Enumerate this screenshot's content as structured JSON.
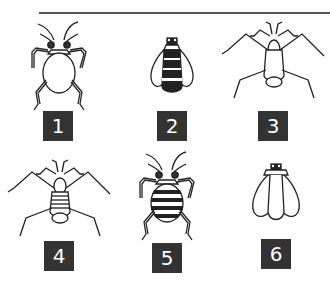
{
  "figure": {
    "colors": {
      "line": "#222222",
      "label_bg": "#333333",
      "label_text": "#ffffff",
      "rule": "#555555"
    },
    "items": [
      {
        "id": 1,
        "label": "1",
        "type": "oval-bodied bug with long legs and antennae, plain abdomen"
      },
      {
        "id": 2,
        "label": "2",
        "type": "winged insect with striped abdomen, top view"
      },
      {
        "id": 3,
        "label": "3",
        "type": "long-legged water strider type, plain body"
      },
      {
        "id": 4,
        "label": "4",
        "type": "long-legged water strider type, striped body"
      },
      {
        "id": 5,
        "label": "5",
        "type": "oval-bodied bug with long legs and antennae, striped abdomen"
      },
      {
        "id": 6,
        "label": "6",
        "type": "winged insect, wings covering body"
      }
    ]
  }
}
